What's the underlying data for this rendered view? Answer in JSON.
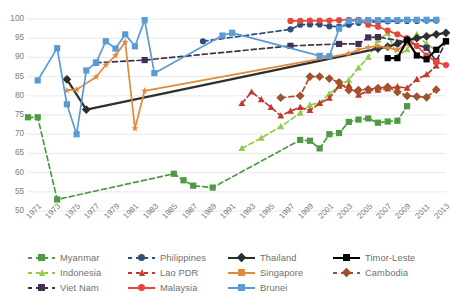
{
  "chart_data": {
    "type": "line",
    "title": "",
    "subtitle": "",
    "xlabel": "",
    "ylabel": "",
    "ylim": [
      50,
      100
    ],
    "ytick_step": 5,
    "yticks": [
      100,
      95,
      90,
      85,
      80,
      75,
      70,
      65,
      60,
      55,
      50
    ],
    "xlim": [
      1971,
      2014
    ],
    "xticks": [
      "1971",
      "1973",
      "1975",
      "1977",
      "1979",
      "1981",
      "1983",
      "1985",
      "1987",
      "1989",
      "1991",
      "1993",
      "1995",
      "1997",
      "1999",
      "2001",
      "2003",
      "2005",
      "2007",
      "2009",
      "2011",
      "2013"
    ],
    "grid": "horizontal",
    "legend_position": "bottom",
    "series": [
      {
        "name": "Myanmar",
        "color": "#4E9A43",
        "marker": "square",
        "dash": "dashed",
        "points": [
          [
            1971,
            74.4
          ],
          [
            1972,
            74.4
          ],
          [
            1974,
            53.0
          ],
          [
            1986,
            59.7
          ],
          [
            1987,
            58.0
          ],
          [
            1988,
            56.6
          ],
          [
            1990,
            56.1
          ],
          [
            1999,
            68.5
          ],
          [
            2000,
            68.3
          ],
          [
            2001,
            66.3
          ],
          [
            2002,
            70.0
          ],
          [
            2003,
            70.3
          ],
          [
            2004,
            73.2
          ],
          [
            2005,
            73.8
          ],
          [
            2006,
            74.1
          ],
          [
            2007,
            73.0
          ],
          [
            2008,
            73.3
          ],
          [
            2009,
            73.5
          ],
          [
            2010,
            77.3
          ]
        ]
      },
      {
        "name": "Indonesia",
        "color": "#92C94B",
        "marker": "triangle",
        "dash": "dashed",
        "points": [
          [
            1993,
            66.3
          ],
          [
            1995,
            69.0
          ],
          [
            1997,
            72.0
          ],
          [
            1999,
            75.5
          ],
          [
            2000,
            77.6
          ],
          [
            2001,
            78.2
          ],
          [
            2002,
            80.5
          ],
          [
            2003,
            82.6
          ],
          [
            2004,
            84.1
          ],
          [
            2005,
            87.3
          ],
          [
            2006,
            90.0
          ],
          [
            2007,
            94.5
          ],
          [
            2008,
            96.3
          ],
          [
            2009,
            90.2
          ],
          [
            2010,
            92.0
          ],
          [
            2011,
            96.0
          ],
          [
            2012,
            93.5
          ],
          [
            2013,
            91.8
          ]
        ]
      },
      {
        "name": "Viet Nam",
        "color": "#403151",
        "marker": "square",
        "dash": "dashed",
        "points": [
          [
            1978,
            88.6
          ],
          [
            1983,
            89.3
          ],
          [
            1998,
            93.0
          ],
          [
            2003,
            93.5
          ],
          [
            2005,
            93.5
          ],
          [
            2006,
            95.2
          ],
          [
            2007,
            95.3
          ],
          [
            2010,
            94.0
          ],
          [
            2012,
            92.5
          ],
          [
            2013,
            89.0
          ],
          [
            2014,
            94.2
          ]
        ]
      },
      {
        "name": "Philippines",
        "color": "#2E4F7C",
        "marker": "circle",
        "dash": "dashed",
        "points": [
          [
            1989,
            94.2
          ],
          [
            1998,
            97.3
          ],
          [
            1999,
            98.5
          ],
          [
            2000,
            98.6
          ],
          [
            2001,
            98.6
          ],
          [
            2002,
            98.1
          ],
          [
            2003,
            98.0
          ],
          [
            2004,
            98.5
          ],
          [
            2005,
            99.0
          ],
          [
            2006,
            99.2
          ],
          [
            2007,
            99.3
          ],
          [
            2008,
            99.4
          ],
          [
            2009,
            99.5
          ],
          [
            2010,
            99.5
          ],
          [
            2011,
            99.5
          ],
          [
            2012,
            99.6
          ],
          [
            2013,
            99.6
          ]
        ]
      },
      {
        "name": "Lao PDR",
        "color": "#C0392B",
        "marker": "triangle",
        "dash": "dashed",
        "points": [
          [
            1993,
            78.0
          ],
          [
            1994,
            81.0
          ],
          [
            1995,
            79.0
          ],
          [
            1996,
            77.0
          ],
          [
            1997,
            74.8
          ],
          [
            1998,
            76.0
          ],
          [
            1999,
            77.0
          ],
          [
            2000,
            76.2
          ],
          [
            2001,
            78.0
          ],
          [
            2002,
            79.4
          ],
          [
            2003,
            82.5
          ],
          [
            2004,
            82.7
          ],
          [
            2005,
            80.2
          ],
          [
            2006,
            81.3
          ],
          [
            2007,
            81.5
          ],
          [
            2008,
            81.8
          ],
          [
            2009,
            82.4
          ],
          [
            2010,
            82.0
          ],
          [
            2011,
            84.3
          ],
          [
            2012,
            85.5
          ],
          [
            2013,
            87.8
          ]
        ]
      },
      {
        "name": "Malaysia",
        "color": "#E8463A",
        "marker": "circle",
        "dash": "solid",
        "points": [
          [
            1998,
            99.5
          ],
          [
            1999,
            99.5
          ],
          [
            2000,
            99.6
          ],
          [
            2001,
            99.6
          ],
          [
            2002,
            99.6
          ],
          [
            2003,
            99.7
          ],
          [
            2004,
            99.8
          ],
          [
            2005,
            99.8
          ],
          [
            2006,
            98.5
          ],
          [
            2007,
            98.0
          ],
          [
            2008,
            97.0
          ],
          [
            2009,
            96.0
          ],
          [
            2010,
            95.0
          ],
          [
            2011,
            93.0
          ],
          [
            2012,
            90.5
          ],
          [
            2013,
            88.8
          ],
          [
            2014,
            88.0
          ]
        ]
      },
      {
        "name": "Thailand",
        "color": "#2E2E2E",
        "marker": "diamond",
        "dash": "solid",
        "points": [
          [
            1975,
            84.3
          ],
          [
            1977,
            76.4
          ],
          [
            2007,
            92.3
          ],
          [
            2008,
            92.8
          ],
          [
            2009,
            93.5
          ],
          [
            2010,
            94.5
          ],
          [
            2011,
            95.0
          ],
          [
            2012,
            95.5
          ],
          [
            2013,
            96.0
          ],
          [
            2014,
            96.4
          ]
        ]
      },
      {
        "name": "Singapore",
        "color": "#E08A3C",
        "marker": "star",
        "dash": "solid",
        "points": [
          [
            1975,
            81.4
          ],
          [
            1976,
            81.6
          ],
          [
            1978,
            84.9
          ],
          [
            1979,
            88.0
          ],
          [
            1980,
            90.5
          ],
          [
            1981,
            94.0
          ],
          [
            1982,
            71.5
          ],
          [
            1983,
            81.3
          ],
          [
            2004,
            91.0
          ],
          [
            2005,
            92.0
          ],
          [
            2006,
            92.6
          ],
          [
            2007,
            93.0
          ],
          [
            2008,
            92.5
          ],
          [
            2009,
            92.0
          ],
          [
            2010,
            93.5
          ]
        ]
      },
      {
        "name": "Brunei",
        "color": "#5B9BD5",
        "marker": "square",
        "dash": "solid",
        "points": [
          [
            1972,
            84.0
          ],
          [
            1974,
            92.4
          ],
          [
            1975,
            77.8
          ],
          [
            1976,
            70.0
          ],
          [
            1977,
            86.6
          ],
          [
            1978,
            88.6
          ],
          [
            1979,
            94.2
          ],
          [
            1980,
            92.3
          ],
          [
            1981,
            96.0
          ],
          [
            1982,
            92.9
          ],
          [
            1983,
            99.7
          ],
          [
            1984,
            85.9
          ],
          [
            1991,
            95.7
          ],
          [
            1992,
            96.4
          ],
          [
            2001,
            90.4
          ],
          [
            2002,
            90.3
          ],
          [
            2003,
            97.5
          ],
          [
            2004,
            99.5
          ],
          [
            2005,
            99.6
          ],
          [
            2006,
            99.7
          ],
          [
            2007,
            99.7
          ],
          [
            2008,
            99.7
          ],
          [
            2009,
            99.7
          ],
          [
            2010,
            99.8
          ],
          [
            2011,
            99.8
          ],
          [
            2012,
            99.8
          ],
          [
            2013,
            99.8
          ]
        ]
      },
      {
        "name": "Timor-Leste",
        "color": "#000000",
        "marker": "square",
        "dash": "solid",
        "points": [
          [
            2008,
            89.8
          ],
          [
            2009,
            89.8
          ],
          [
            2010,
            94.5
          ],
          [
            2011,
            90.5
          ],
          [
            2012,
            89.5
          ],
          [
            2013,
            92.0
          ],
          [
            2014,
            94.2
          ]
        ]
      },
      {
        "name": "Cambodia",
        "color": "#A0522D",
        "marker": "diamond",
        "dash": "dashed",
        "points": [
          [
            1997,
            79.5
          ],
          [
            1999,
            80.0
          ],
          [
            2000,
            85.0
          ],
          [
            2001,
            85.0
          ],
          [
            2002,
            84.5
          ],
          [
            2003,
            83.5
          ],
          [
            2004,
            81.5
          ],
          [
            2005,
            81.5
          ],
          [
            2006,
            81.7
          ],
          [
            2007,
            82.0
          ],
          [
            2008,
            82.3
          ],
          [
            2009,
            81.0
          ],
          [
            2010,
            80.0
          ],
          [
            2011,
            79.8
          ],
          [
            2012,
            79.6
          ],
          [
            2013,
            81.6
          ]
        ]
      }
    ]
  },
  "legend": {
    "items": [
      {
        "label": "Myanmar",
        "color": "#4E9A43",
        "marker": "square",
        "dash": "dashed",
        "col": 0,
        "row": 0
      },
      {
        "label": "Philippines",
        "color": "#2E4F7C",
        "marker": "circle",
        "dash": "dashed",
        "col": 1,
        "row": 0
      },
      {
        "label": "Thailand",
        "color": "#2E2E2E",
        "marker": "diamond",
        "dash": "solid",
        "col": 2,
        "row": 0
      },
      {
        "label": "Timor-Leste",
        "color": "#000000",
        "marker": "square",
        "dash": "solid",
        "col": 3,
        "row": 0
      },
      {
        "label": "Indonesia",
        "color": "#92C94B",
        "marker": "triangle",
        "dash": "dashed",
        "col": 0,
        "row": 1
      },
      {
        "label": "Lao PDR",
        "color": "#C0392B",
        "marker": "triangle",
        "dash": "dashed",
        "col": 1,
        "row": 1
      },
      {
        "label": "Singapore",
        "color": "#E08A3C",
        "marker": "star",
        "dash": "solid",
        "col": 2,
        "row": 1
      },
      {
        "label": "Cambodia",
        "color": "#A0522D",
        "marker": "diamond",
        "dash": "dashed",
        "col": 3,
        "row": 1
      },
      {
        "label": "Viet Nam",
        "color": "#403151",
        "marker": "square",
        "dash": "dashed",
        "col": 0,
        "row": 2
      },
      {
        "label": "Malaysia",
        "color": "#E8463A",
        "marker": "circle",
        "dash": "solid",
        "col": 1,
        "row": 2
      },
      {
        "label": "Brunei",
        "color": "#5B9BD5",
        "marker": "square",
        "dash": "solid",
        "col": 2,
        "row": 2
      }
    ]
  },
  "colors": {
    "grid": "#E3E3E3",
    "axis_text": "#7d7d7d",
    "background": "#ffffff"
  }
}
